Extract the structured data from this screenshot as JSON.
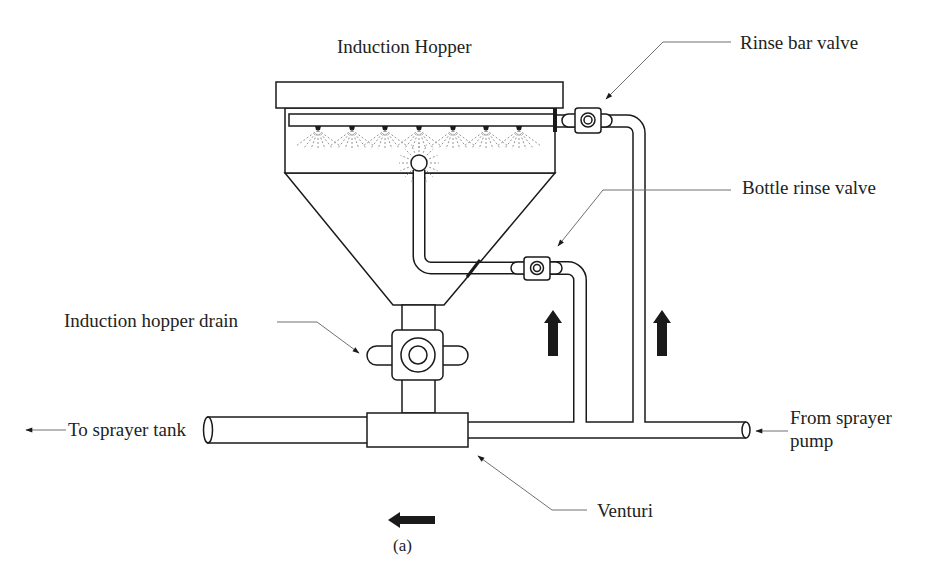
{
  "figure": {
    "title": "Induction Hopper",
    "caption": "(a)",
    "labels": {
      "rinse_bar_valve": "Rinse bar valve",
      "bottle_rinse_valve": "Bottle rinse valve",
      "induction_hopper_drain": "Induction hopper drain",
      "to_sprayer_tank": "To sprayer tank",
      "from_sprayer_pump_line1": "From sprayer",
      "from_sprayer_pump_line2": "pump",
      "venturi": "Venturi"
    },
    "components": {
      "rinse_bar_nozzle_count": 7,
      "valves": [
        "rinse-bar-valve",
        "bottle-rinse-valve",
        "induction-hopper-drain-valve"
      ]
    },
    "flow_arrows": [
      {
        "name": "bottle-rinse-flow",
        "direction": "up"
      },
      {
        "name": "rinse-bar-flow",
        "direction": "up"
      },
      {
        "name": "main-line-flow",
        "direction": "left"
      }
    ]
  },
  "colors": {
    "line": "#1a1a1a",
    "leader": "#707070",
    "text": "#222222",
    "background": "#ffffff"
  }
}
